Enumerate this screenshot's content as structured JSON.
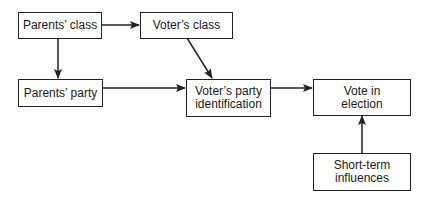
{
  "diagram": {
    "type": "flowchart",
    "nodes": [
      {
        "id": "parents_class",
        "label": "Parents’ class"
      },
      {
        "id": "voters_class",
        "label": "Voter’s class"
      },
      {
        "id": "parents_party",
        "label": "Parents’ party"
      },
      {
        "id": "voters_party_id",
        "label": "Voter’s party identification",
        "lines": [
          "Voter’s party",
          "identification"
        ]
      },
      {
        "id": "vote_in_election",
        "label": "Vote in election",
        "lines": [
          "Vote in",
          "election"
        ]
      },
      {
        "id": "short_term",
        "label": "Short-term influences",
        "lines": [
          "Short-term",
          "influences"
        ]
      }
    ],
    "edges": [
      {
        "from": "parents_class",
        "to": "voters_class"
      },
      {
        "from": "parents_class",
        "to": "parents_party"
      },
      {
        "from": "voters_class",
        "to": "voters_party_id"
      },
      {
        "from": "parents_party",
        "to": "voters_party_id"
      },
      {
        "from": "voters_party_id",
        "to": "vote_in_election"
      },
      {
        "from": "short_term",
        "to": "vote_in_election"
      }
    ]
  }
}
